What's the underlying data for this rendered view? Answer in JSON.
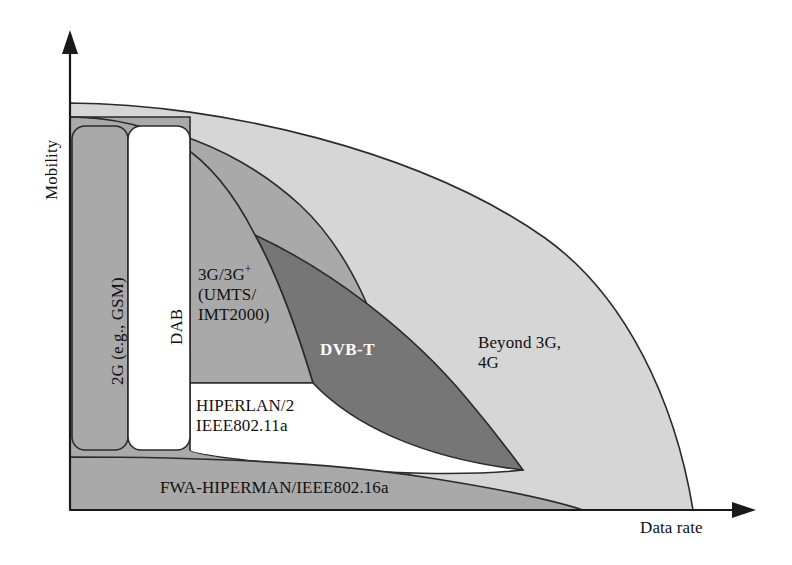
{
  "figure": {
    "axes": {
      "y_label": "Mobility",
      "x_label": "Data rate"
    },
    "regions": [
      {
        "id": "2g",
        "label": "2G (e.g., GSM)",
        "fill": "#a9a9a9",
        "orientation": "vertical"
      },
      {
        "id": "dab",
        "label": "DAB",
        "fill": "#ffffff",
        "orientation": "vertical"
      },
      {
        "id": "3g",
        "label_line1": "3G/3G",
        "label_sup": "+",
        "label_line2": "(UMTS/",
        "label_line3": "IMT2000)",
        "fill": "#a9a9a9",
        "orientation": "horizontal"
      },
      {
        "id": "dvbt",
        "label": "DVB-T",
        "fill": "#767676",
        "orientation": "horizontal"
      },
      {
        "id": "beyond3g",
        "label_line1": "Beyond 3G,",
        "label_line2": "4G",
        "fill": "#d6d6d6",
        "orientation": "horizontal"
      },
      {
        "id": "hiperlan",
        "label_line1": "HIPERLAN/2",
        "label_line2": "IEEE802.11a",
        "fill": "#ffffff",
        "orientation": "horizontal"
      },
      {
        "id": "fwa",
        "label": "FWA-HIPERMAN/IEEE802.16a",
        "fill": "#a9a9a9",
        "orientation": "horizontal"
      }
    ],
    "colors": {
      "outline": "#2b2b2b",
      "mid_gray": "#a9a9a9",
      "dark_gray": "#767676",
      "light_gray": "#d6d6d6",
      "white": "#ffffff",
      "text": "#111111"
    }
  }
}
